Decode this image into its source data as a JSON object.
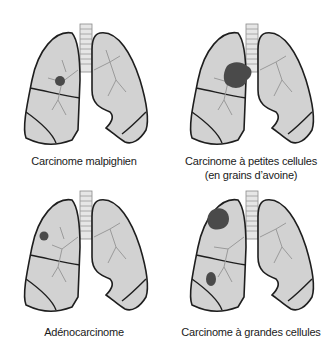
{
  "diagram": {
    "type": "lung-cancer-types-illustration",
    "colors": {
      "lung_fill": "#d2d2d2",
      "lung_highlight": "#ebebeb",
      "outline": "#1e1e1e",
      "bronchi": "#9a9a9a",
      "tumor": "#4a4a4a",
      "trachea": "#e6e6e6"
    },
    "panels": [
      {
        "id": "top-left",
        "caption_lines": [
          "Carcinome malpighien"
        ],
        "tumor": "small central nodule, right upper lobe near hilum"
      },
      {
        "id": "top-right",
        "caption_lines": [
          "Carcinome à petites cellules",
          "(en grains d’avoine)"
        ],
        "tumor": "large mass at hilum next to bronchus"
      },
      {
        "id": "bottom-left",
        "caption_lines": [
          "Adénocarcinome"
        ],
        "tumor": "small peripheral nodule, right upper lobe"
      },
      {
        "id": "bottom-right",
        "caption_lines": [
          "Carcinome à grandes cellules"
        ],
        "tumor": "peripheral masses in upper and middle lobes"
      }
    ]
  }
}
